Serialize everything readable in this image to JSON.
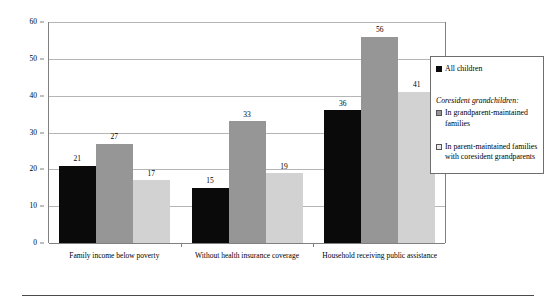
{
  "chart_data": {
    "type": "bar",
    "title": "",
    "subtitle": "",
    "xlabel": "",
    "ylabel": "",
    "ylim": [
      0,
      60
    ],
    "yticks": [
      0,
      10,
      20,
      30,
      40,
      50,
      60
    ],
    "ytick_labels": [
      "0",
      "10",
      "20",
      "30",
      "40",
      "50",
      "60"
    ],
    "grid": true,
    "legend_position": "right",
    "categories": [
      "Family income below poverty",
      "Without health insurance coverage",
      "Household receiving public assistance"
    ],
    "series": [
      {
        "name": "All children",
        "color": "#0a0a0a",
        "values": [
          21,
          15,
          36
        ],
        "value_labels": [
          "21",
          "15",
          "36"
        ]
      },
      {
        "name": "In grandparent-maintained families",
        "color": "#969696",
        "values": [
          27,
          33,
          56
        ],
        "value_labels": [
          "27",
          "33",
          "56"
        ]
      },
      {
        "name": "In parent-maintained families with coresident grandparents",
        "color": "#d2d2d2",
        "values": [
          17,
          19,
          41
        ],
        "value_labels": [
          "17",
          "19",
          "41"
        ]
      }
    ]
  },
  "legend": {
    "entries": [
      {
        "label": "All children",
        "swatch": "black-square-icon"
      },
      {
        "label": "In grandparent-maintained families",
        "swatch": "gray-square-icon"
      },
      {
        "label": "In parent-maintained families with coresident grandparents",
        "swatch": "light-gray-square-icon"
      }
    ],
    "subtitle": "Coresident grandchildren:"
  },
  "colors": {
    "series_1": "#0a0a0a",
    "series_2": "#969696",
    "series_3": "#d2d2d2",
    "gridline": "#b5b5b5",
    "axis": "#808080",
    "legend_border": "#6e6e6e",
    "rule": "#4a4a4a"
  }
}
